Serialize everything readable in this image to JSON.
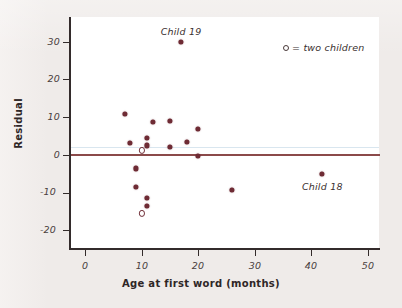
{
  "chart_data": {
    "type": "scatter",
    "title": "",
    "xlabel": "Age at first word (months)",
    "ylabel": "Residual",
    "xlim": [
      -2,
      54
    ],
    "ylim": [
      -22,
      34
    ],
    "xticks": [
      0,
      10,
      20,
      30,
      40,
      50
    ],
    "yticks": [
      30,
      20,
      10,
      0,
      -10,
      -20
    ],
    "xtick_labels": [
      "0",
      "10",
      "20",
      "30",
      "40",
      "50"
    ],
    "ytick_labels": [
      "30",
      "20",
      "10",
      "0",
      "-10",
      "-20"
    ],
    "grid": false,
    "reference_line": {
      "y": 0,
      "color": "#8b4a4a"
    },
    "marker_color": "#6e2b34",
    "points": [
      {
        "x": 7,
        "y": 11.0,
        "marker": "filled",
        "label": ""
      },
      {
        "x": 8,
        "y": 3.2,
        "marker": "filled",
        "label": ""
      },
      {
        "x": 9,
        "y": -3.6,
        "marker": "filled",
        "label": ""
      },
      {
        "x": 9,
        "y": -8.6,
        "marker": "filled",
        "label": ""
      },
      {
        "x": 10,
        "y": 1.2,
        "marker": "open",
        "label": ""
      },
      {
        "x": 10,
        "y": -15.6,
        "marker": "open",
        "label": ""
      },
      {
        "x": 11,
        "y": 4.6,
        "marker": "filled",
        "label": ""
      },
      {
        "x": 11,
        "y": 2.5,
        "marker": "filled",
        "label": ""
      },
      {
        "x": 11,
        "y": -11.5,
        "marker": "filled",
        "label": ""
      },
      {
        "x": 11,
        "y": -13.5,
        "marker": "filled",
        "label": ""
      },
      {
        "x": 12,
        "y": 8.8,
        "marker": "filled",
        "label": ""
      },
      {
        "x": 15,
        "y": 9.0,
        "marker": "filled",
        "label": ""
      },
      {
        "x": 15,
        "y": 2.2,
        "marker": "filled",
        "label": ""
      },
      {
        "x": 17,
        "y": 30.0,
        "marker": "filled",
        "label": "Child 19"
      },
      {
        "x": 18,
        "y": 3.5,
        "marker": "filled",
        "label": ""
      },
      {
        "x": 20,
        "y": 6.8,
        "marker": "filled",
        "label": ""
      },
      {
        "x": 20,
        "y": -0.3,
        "marker": "filled",
        "label": ""
      },
      {
        "x": 26,
        "y": -9.3,
        "marker": "filled",
        "label": ""
      },
      {
        "x": 42,
        "y": -5.1,
        "marker": "filled",
        "label": "Child 18"
      }
    ],
    "annotations": [
      {
        "text": "Child 19",
        "x": 17,
        "y": 33.0
      },
      {
        "text": "Child 18",
        "x": 42,
        "y": -8.3
      }
    ],
    "legend": {
      "position": "top-right",
      "marker": "open-circle",
      "text": "= two children",
      "full_text": "o = two children"
    }
  }
}
